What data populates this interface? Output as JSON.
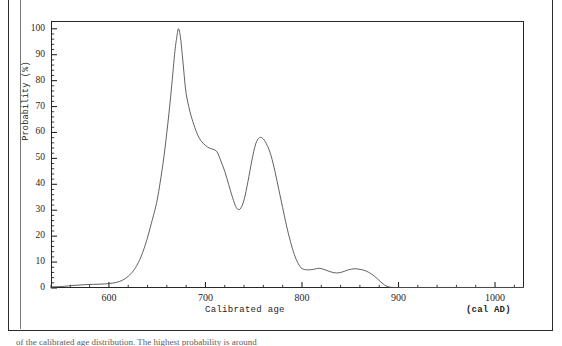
{
  "figure": {
    "caption": "of the calibrated age distribution. The highest probability is around"
  },
  "axes": {
    "y_axis_title": "Probability (%)",
    "x_axis_title": "Calibrated age",
    "x_axis_unit": "(cal AD)",
    "y_ticks": [
      0,
      10,
      20,
      30,
      40,
      50,
      60,
      70,
      80,
      90,
      100
    ],
    "x_ticks": [
      600,
      700,
      800,
      900,
      1000
    ]
  },
  "chart_data": {
    "type": "line",
    "title": "",
    "xlabel": "Calibrated age",
    "ylabel": "Probability (%)",
    "xunit": "(cal AD)",
    "xlim": [
      540,
      1030
    ],
    "ylim": [
      0,
      103
    ],
    "grid": false,
    "legend": "none",
    "line_color": "#4a4a4a",
    "series": [
      {
        "name": "Calibrated age probability distribution",
        "x": [
          540,
          552,
          560,
          568,
          576,
          584,
          592,
          600,
          608,
          614,
          620,
          626,
          632,
          638,
          644,
          650,
          656,
          660,
          664,
          668,
          670,
          672,
          674,
          676,
          678,
          680,
          684,
          688,
          692,
          696,
          700,
          704,
          708,
          712,
          716,
          720,
          724,
          728,
          732,
          736,
          740,
          744,
          748,
          752,
          756,
          760,
          764,
          768,
          772,
          776,
          780,
          784,
          788,
          792,
          796,
          800,
          806,
          812,
          818,
          824,
          830,
          836,
          842,
          848,
          854,
          860,
          866,
          872,
          878,
          884,
          890,
          900,
          920,
          950,
          1000,
          1030
        ],
        "y": [
          0.4,
          0.6,
          0.9,
          1.1,
          1.3,
          1.4,
          1.5,
          1.7,
          2.2,
          3.0,
          4.5,
          7.0,
          11.0,
          17.0,
          25.0,
          34.0,
          48.0,
          60.0,
          74.0,
          90.0,
          96.0,
          100.0,
          97.0,
          90.0,
          82.0,
          75.0,
          68.0,
          63.0,
          59.0,
          56.5,
          55.0,
          54.0,
          53.5,
          52.5,
          49.0,
          45.0,
          40.0,
          35.0,
          31.0,
          30.5,
          34.0,
          41.0,
          49.0,
          55.5,
          58.0,
          57.5,
          55.0,
          51.0,
          45.0,
          38.0,
          31.0,
          24.0,
          18.0,
          13.0,
          9.5,
          7.5,
          7.0,
          7.2,
          7.6,
          7.0,
          6.2,
          5.8,
          6.2,
          7.0,
          7.4,
          7.2,
          6.6,
          5.4,
          3.6,
          1.6,
          0.4,
          0.2,
          0.2,
          0.2,
          0.2,
          0.2
        ]
      }
    ]
  }
}
